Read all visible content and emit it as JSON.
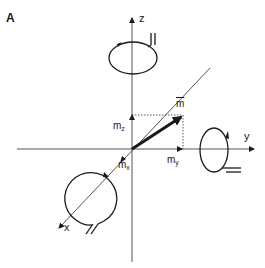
{
  "figure": {
    "panel_label": "A",
    "axes": {
      "x_label": "x",
      "y_label": "y",
      "z_label": "z"
    },
    "vector": {
      "label": "m",
      "components": {
        "mx": {
          "base": "m",
          "sub": "x"
        },
        "my": {
          "base": "m",
          "sub": "y"
        },
        "mz": {
          "base": "m",
          "sub": "z"
        }
      }
    },
    "coils": [
      {
        "name": "z-coil",
        "axis": "z"
      },
      {
        "name": "y-coil",
        "axis": "y"
      },
      {
        "name": "x-coil",
        "axis": "x"
      }
    ],
    "colors": {
      "line": "#1a1a1a",
      "thin_axis": "#444444",
      "background": "#ffffff"
    }
  }
}
